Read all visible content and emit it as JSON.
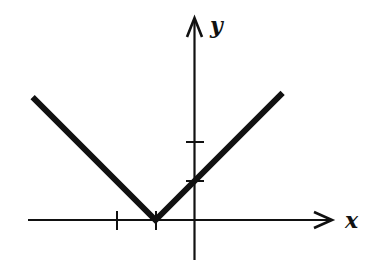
{
  "chart_data": {
    "type": "line",
    "title": "",
    "function": "y = |x + 1|",
    "xlabel": "x",
    "ylabel": "y",
    "x_ticks": [
      -2,
      -1
    ],
    "y_ticks": [
      1,
      2
    ],
    "xlim": [
      -4.3,
      3.6
    ],
    "ylim": [
      -1.0,
      5.2
    ],
    "grid": false,
    "legend": null,
    "series": [
      {
        "name": "V-shaped graph",
        "x": [
          -4.15,
          -1,
          2.26
        ],
        "y": [
          3.15,
          0,
          3.26
        ]
      }
    ],
    "key_points": {
      "vertex": [
        -1,
        0
      ],
      "y_intercept": [
        0,
        1
      ]
    },
    "line_color": "#111111"
  },
  "labels": {
    "x_axis": "x",
    "y_axis": "y"
  }
}
